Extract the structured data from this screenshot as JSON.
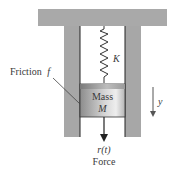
{
  "diagram": {
    "spring_label": "K",
    "mass_label_line1": "Mass",
    "mass_label_line2": "M",
    "friction_label": "Friction",
    "friction_symbol": "f",
    "displacement_label": "y",
    "force_symbol": "r(t)",
    "force_label": "Force"
  },
  "colors": {
    "wall": "#a7a7a7",
    "beam": "#a9a9a9",
    "mass_dark": "#8c8c8c",
    "mass_light": "#e8e8e8",
    "line": "#222222",
    "text": "#3a3a3a"
  }
}
